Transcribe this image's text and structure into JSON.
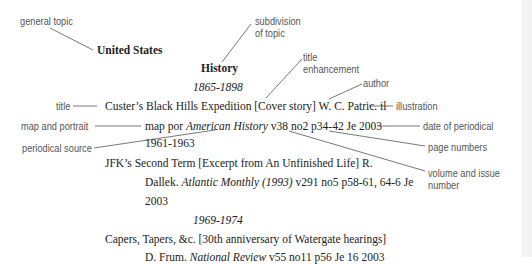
{
  "annotations": {
    "general_topic": "general topic",
    "subdivision_line1": "subdivision",
    "subdivision_line2": "of topic",
    "title_enh_line1": "title",
    "title_enh_line2": "enhancement",
    "author": "author",
    "title": "title",
    "illustration": "illustration",
    "map_and_portrait": "map and portrait",
    "date_of_periodical": "date of periodical",
    "periodical_source": "periodical source",
    "page_numbers": "page numbers",
    "volume_line1": "volume and issue",
    "volume_line2": "number"
  },
  "entry": {
    "heading": "United States",
    "subheading": "History",
    "periods": [
      "1865-1898",
      "1961-1963",
      "1969-1974"
    ],
    "items": [
      {
        "line1": "Custer’s Black Hills Expedition [Cover story] W. C. Patric. il",
        "line2_pre": "map por ",
        "line2_source": "American History",
        "line2_post": " v38 no2 p34-42 Je 2003"
      },
      {
        "line1": "JFK’s Second Term [Excerpt from An Unfinished Life] R.",
        "line2_pre": "Dallek. ",
        "line2_source": "Atlantic Monthly (1993)",
        "line2_post": " v291 no5 p58-61, 64-6 Je",
        "line3": "2003"
      },
      {
        "line1": "Capers, Tapers, &c. [30th anniversary of Watergate hearings]",
        "line2_pre": "D. Frum. ",
        "line2_source": "National Review",
        "line2_post": " v55 no11 p56 Je 16 2003"
      }
    ]
  }
}
